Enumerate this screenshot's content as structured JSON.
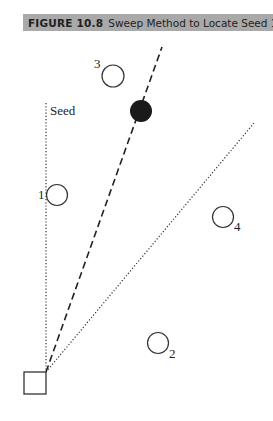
{
  "figure": {
    "number": "FIGURE 10.8",
    "caption": "Sweep Method to Locate Seed 1"
  },
  "diagram": {
    "origin_label": "",
    "seed_line_label": "Seed",
    "nodes": [
      {
        "id": "1",
        "label": "1",
        "filled": false
      },
      {
        "id": "2",
        "label": "2",
        "filled": false
      },
      {
        "id": "3",
        "label": "3",
        "filled": false
      },
      {
        "id": "4",
        "label": "4",
        "filled": false
      },
      {
        "id": "seed",
        "label": "",
        "filled": true
      }
    ],
    "lines": [
      {
        "name": "seed-reference-line",
        "style": "dotted",
        "direction": "vertical"
      },
      {
        "name": "sweep-line",
        "style": "dashed",
        "passes_through": "seed"
      },
      {
        "name": "sweep-boundary-line",
        "style": "dotted"
      }
    ]
  }
}
